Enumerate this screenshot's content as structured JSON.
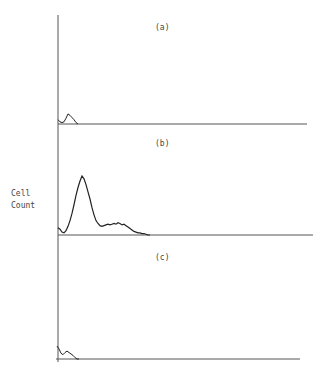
{
  "chart_data": [
    {
      "type": "line",
      "panel": "(a)",
      "title": "(a)",
      "xlabel": "",
      "ylabel": "Cell Count",
      "grid": false,
      "x": [
        0,
        2,
        4,
        6,
        8,
        10,
        12,
        14,
        16,
        18,
        20
      ],
      "values": [
        6,
        3,
        2,
        3,
        8,
        14,
        12,
        9,
        6,
        2,
        0
      ]
    },
    {
      "type": "line",
      "panel": "(b)",
      "title": "(b)",
      "xlabel": "",
      "ylabel": "Cell Count",
      "grid": false,
      "x": [
        0,
        2,
        4,
        6,
        8,
        10,
        12,
        14,
        16,
        18,
        20,
        22,
        24,
        26,
        28,
        30,
        32,
        34,
        36,
        38,
        40,
        42,
        44,
        46,
        48,
        50,
        52,
        54,
        56,
        58,
        60,
        62,
        64,
        66,
        68,
        70,
        72,
        74,
        76,
        78,
        80,
        82,
        84,
        86,
        88,
        90,
        92
      ],
      "values": [
        10,
        8,
        4,
        3,
        6,
        12,
        20,
        30,
        42,
        55,
        66,
        75,
        82,
        78,
        70,
        60,
        50,
        38,
        28,
        20,
        16,
        13,
        12,
        13,
        14,
        15,
        14,
        15,
        16,
        15,
        17,
        16,
        14,
        15,
        13,
        11,
        9,
        7,
        5,
        4,
        3,
        3,
        2,
        2,
        1,
        0,
        0
      ]
    },
    {
      "type": "line",
      "panel": "(c)",
      "title": "(c)",
      "xlabel": "",
      "ylabel": "Cell Count",
      "grid": false,
      "x": [
        0,
        2,
        4,
        6,
        8,
        10,
        12,
        14,
        16,
        18,
        20,
        22
      ],
      "values": [
        18,
        14,
        8,
        6,
        9,
        11,
        9,
        7,
        5,
        2,
        0,
        0
      ]
    }
  ],
  "labels": {
    "ylabel_line1": "Cell",
    "ylabel_line2": "Count",
    "panel_a": "(a)",
    "panel_b": "(b)",
    "panel_c": "(c)"
  }
}
